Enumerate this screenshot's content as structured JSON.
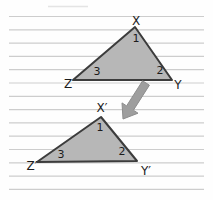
{
  "scene": {
    "width": 213,
    "height": 200,
    "background": "#fefefe"
  },
  "paper": {
    "line_color": "#cdcdcd",
    "x1": 9,
    "x2": 204,
    "start_y": 16.5,
    "spacing": 13.3,
    "count": 14,
    "partial_line": {
      "x1": 48,
      "x2": 88,
      "y": 6.5,
      "color": "#e4e4e4"
    }
  },
  "triangles": [
    {
      "id": "XYZ",
      "fill": "#b7b7b7",
      "stroke": "#3c3c3c",
      "stroke_width": 2,
      "vertices": [
        [
          135,
          27
        ],
        [
          73,
          80
        ],
        [
          172,
          80
        ]
      ],
      "vertex_labels": [
        {
          "text": "X",
          "x": 136,
          "y": 25
        },
        {
          "text": "Z",
          "x": 68,
          "y": 88
        },
        {
          "text": "Y",
          "x": 178,
          "y": 89
        }
      ],
      "angle_labels": [
        {
          "text": "1",
          "x": 136,
          "y": 42
        },
        {
          "text": "3",
          "x": 97,
          "y": 75
        },
        {
          "text": "2",
          "x": 160,
          "y": 74
        }
      ]
    },
    {
      "id": "XpYpZp",
      "fill": "#b7b7b7",
      "stroke": "#3c3c3c",
      "stroke_width": 2,
      "vertices": [
        [
          101,
          117
        ],
        [
          37,
          162
        ],
        [
          137,
          161
        ]
      ],
      "vertex_labels": [
        {
          "text": "X′",
          "x": 102,
          "y": 112
        },
        {
          "text": "Z′",
          "x": 32,
          "y": 170
        },
        {
          "text": "Y′",
          "x": 146,
          "y": 175
        }
      ],
      "angle_labels": [
        {
          "text": "1",
          "x": 100,
          "y": 131
        },
        {
          "text": "3",
          "x": 61,
          "y": 158
        },
        {
          "text": "2",
          "x": 122,
          "y": 155
        }
      ]
    }
  ],
  "arrow": {
    "fill": "#9e9e9e",
    "stroke": "#8d8d8d",
    "tail": [
      146,
      83
    ],
    "tip": [
      123,
      119
    ],
    "shaft_width": 8,
    "head_width": 19,
    "head_length": 13
  }
}
